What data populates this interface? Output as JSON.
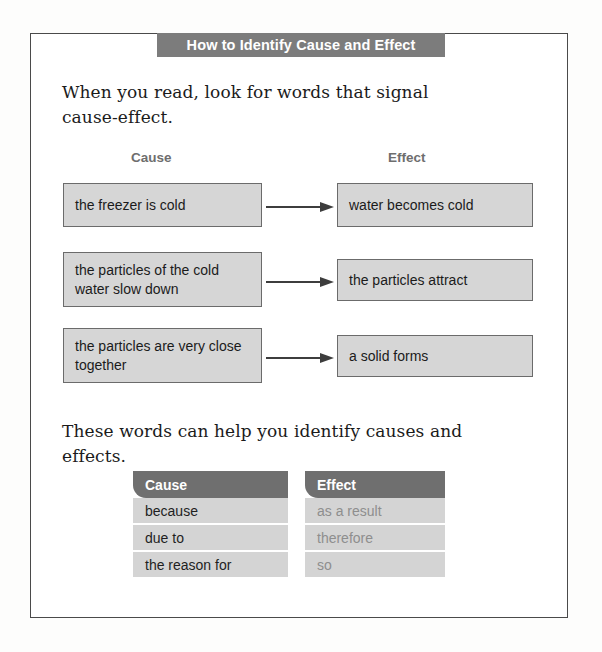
{
  "page": {
    "title_banner": "How to Identify Cause and Effect",
    "intro_text": "When you read, look for words that signal cause-effect.",
    "mid_text": "These words can help you identify causes and effects."
  },
  "flow": {
    "column_headings": {
      "cause": "Cause",
      "effect": "Effect"
    },
    "rows": [
      {
        "cause": "the freezer is cold",
        "effect": "water becomes cold",
        "arrow": "arrow-right-icon"
      },
      {
        "cause": "the particles of the cold water slow down",
        "effect": "the particles attract",
        "arrow": "arrow-right-icon"
      },
      {
        "cause": "the particles are very close together",
        "effect": "a solid forms",
        "arrow": "arrow-right-icon"
      }
    ]
  },
  "word_table": {
    "cause": {
      "header": "Cause",
      "items": [
        "because",
        "due to",
        "the reason for"
      ]
    },
    "effect": {
      "header": "Effect",
      "items": [
        "as a result",
        "therefore",
        "so"
      ]
    }
  },
  "colors": {
    "banner_gray": "#7c7c7c",
    "box_fill": "#d6d6d6",
    "box_border": "#6b6b6b",
    "table_header": "#6f6f6f",
    "table_row": "#d4d4d4",
    "effect_text": "#8e8e8e",
    "frame_border": "#4a4a4a"
  }
}
